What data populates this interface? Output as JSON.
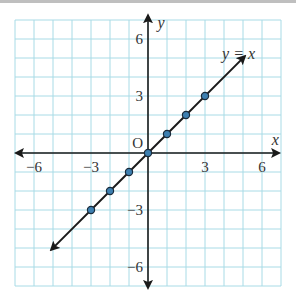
{
  "chart_data": {
    "type": "line",
    "title": "",
    "xlabel": "x",
    "ylabel": "y",
    "origin_label": "O",
    "xlim": [
      -7,
      7
    ],
    "ylim": [
      -7,
      7
    ],
    "grid": true,
    "x_ticks": [
      {
        "value": -6,
        "label": "−6"
      },
      {
        "value": -3,
        "label": "−3"
      },
      {
        "value": 3,
        "label": "3"
      },
      {
        "value": 6,
        "label": "6"
      }
    ],
    "y_ticks": [
      {
        "value": 6,
        "label": "6"
      },
      {
        "value": 3,
        "label": "3"
      },
      {
        "value": -3,
        "label": "−3"
      },
      {
        "value": -6,
        "label": "−6"
      }
    ],
    "series": [
      {
        "name": "y = x",
        "equation_label": "y = x",
        "line_from": [
          -5.1,
          -5.1
        ],
        "line_to": [
          5.1,
          5.1
        ],
        "arrows_both_ends": true,
        "points": [
          [
            -3,
            -3
          ],
          [
            -2,
            -2
          ],
          [
            -1,
            -1
          ],
          [
            0,
            0
          ],
          [
            1,
            1
          ],
          [
            2,
            2
          ],
          [
            3,
            3
          ]
        ]
      }
    ],
    "colors": {
      "grid": "#a8dbe6",
      "axis": "#1a1a1a",
      "line": "#1a1a1a",
      "point_fill": "#3d7fb0",
      "point_stroke": "#1a2a3a"
    }
  }
}
